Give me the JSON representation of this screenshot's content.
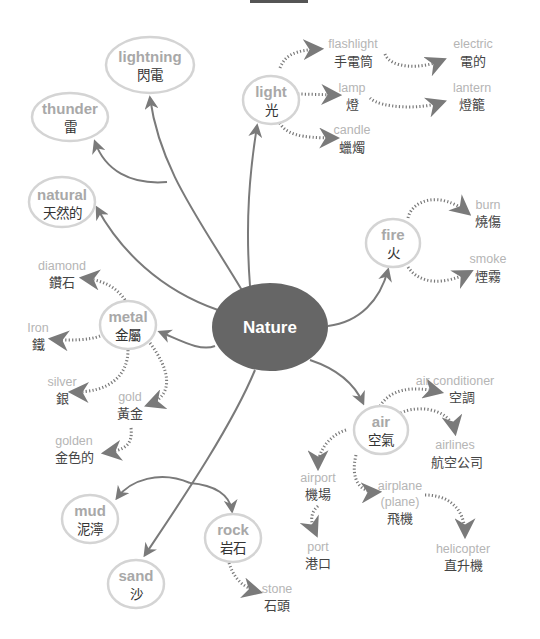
{
  "title_partial": "...",
  "center": {
    "label": "Nature",
    "fill": "#666666"
  },
  "colors": {
    "line": "#7a7a7a",
    "ring": "#d4d4d4",
    "english_text": "#b5b5b5",
    "chinese_text": "#444444",
    "center_fill": "#666666"
  },
  "primary_nodes": [
    {
      "id": "lightning",
      "en": "lightning",
      "zh": "閃電"
    },
    {
      "id": "thunder",
      "en": "thunder",
      "zh": "雷"
    },
    {
      "id": "natural",
      "en": "natural",
      "zh": "天然的"
    },
    {
      "id": "light",
      "en": "light",
      "zh": "光"
    },
    {
      "id": "fire",
      "en": "fire",
      "zh": "火"
    },
    {
      "id": "metal",
      "en": "metal",
      "zh": "金屬"
    },
    {
      "id": "air",
      "en": "air",
      "zh": "空氣"
    },
    {
      "id": "mud",
      "en": "mud",
      "zh": "泥濘"
    },
    {
      "id": "rock",
      "en": "rock",
      "zh": "岩石"
    },
    {
      "id": "sand",
      "en": "sand",
      "zh": "沙"
    }
  ],
  "secondary_nodes": {
    "light": [
      {
        "en": "flashlight",
        "zh": "手電筒"
      },
      {
        "en": "lamp",
        "zh": "燈"
      },
      {
        "en": "candle",
        "zh": "蠟燭"
      }
    ],
    "light_tertiary": [
      {
        "en": "electric",
        "zh": "電的",
        "from": "flashlight"
      },
      {
        "en": "lantern",
        "zh": "燈籠",
        "from": "lamp"
      }
    ],
    "fire": [
      {
        "en": "burn",
        "zh": "燒傷"
      },
      {
        "en": "smoke",
        "zh": "煙霧"
      }
    ],
    "metal": [
      {
        "en": "diamond",
        "zh": "鑽石"
      },
      {
        "en": "Iron",
        "zh": "鐵"
      },
      {
        "en": "silver",
        "zh": "銀"
      },
      {
        "en": "gold",
        "zh": "黃金"
      }
    ],
    "metal_tertiary": [
      {
        "en": "golden",
        "zh": "金色的",
        "from": "gold"
      }
    ],
    "air": [
      {
        "en": "air conditioner",
        "zh": "空調"
      },
      {
        "en": "airlines",
        "zh": "航空公司"
      },
      {
        "en": "airport",
        "zh": "機場"
      },
      {
        "en": "airplane",
        "en2": "(plane)",
        "zh": "飛機"
      }
    ],
    "air_tertiary": [
      {
        "en": "port",
        "zh": "港口",
        "from": "airport"
      },
      {
        "en": "helicopter",
        "zh": "直升機",
        "from": "airplane"
      }
    ],
    "rock": [
      {
        "en": "stone",
        "zh": "石頭"
      }
    ]
  }
}
